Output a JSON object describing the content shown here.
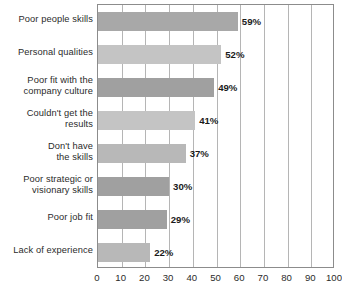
{
  "chart_data": {
    "type": "bar",
    "orientation": "horizontal",
    "title": "",
    "xlabel": "",
    "ylabel": "",
    "xlim": [
      0,
      100
    ],
    "xticks": [
      0,
      10,
      20,
      30,
      40,
      50,
      60,
      70,
      80,
      90,
      100
    ],
    "grid": true,
    "legend": false,
    "categories": [
      "Poor people skills",
      "Personal qualities",
      "Poor fit with the company culture",
      "Couldn't get the results",
      "Don't have the skills",
      "Poor strategic or visionary skills",
      "Poor job fit",
      "Lack of experience"
    ],
    "values": [
      59,
      52,
      49,
      41,
      37,
      30,
      29,
      22
    ],
    "value_labels": [
      "59%",
      "52%",
      "49%",
      "41%",
      "37%",
      "30%",
      "29%",
      "22%"
    ],
    "bar_colors": [
      "#a8a8a8",
      "#c4c4c4",
      "#a0a0a0",
      "#c4c4c4",
      "#b8b8b8",
      "#a0a0a0",
      "#a0a0a0",
      "#b8b8b8"
    ]
  },
  "axis": {
    "tick_labels": [
      "0",
      "10",
      "20",
      "30",
      "40",
      "50",
      "60",
      "70",
      "80",
      "90",
      "100"
    ]
  },
  "category_lines": [
    [
      "Poor people skills"
    ],
    [
      "Personal qualities"
    ],
    [
      "Poor fit with the",
      "company culture"
    ],
    [
      "Couldn't get the",
      "results"
    ],
    [
      "Don't have",
      "the skills"
    ],
    [
      "Poor strategic or",
      "visionary skills"
    ],
    [
      "Poor job fit"
    ],
    [
      "Lack of experience"
    ]
  ],
  "style": {
    "frame_color": "#8c8c8c",
    "gridline_color": "#b5b5b5",
    "background": "#ffffff",
    "text_color": "#2b2b2b"
  }
}
